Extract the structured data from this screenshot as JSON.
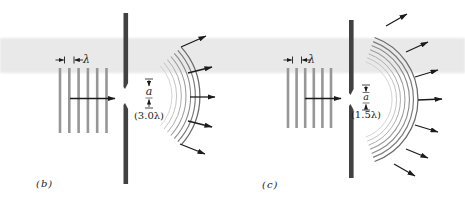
{
  "figure": {
    "background": "#ffffff",
    "ink": "#1b1b1b",
    "band": {
      "y": 38,
      "height": 35,
      "color": "#e9e9e9"
    },
    "panels": [
      {
        "id": "b",
        "caption": "(b)",
        "wavefronts": {
          "x0": 60,
          "spacing": 9.3,
          "count": 6,
          "y0": 68,
          "y1": 133,
          "width": 2.6,
          "color": "#979797"
        },
        "lambda_marker": {
          "label": "λ",
          "tick1": 64.5,
          "tick2": 74,
          "y": 60
        },
        "prop_arrow": {
          "x0": 70,
          "y0": 98.5,
          "x1": 115,
          "y1": 98.5
        },
        "barrier": {
          "x": 123.5,
          "width": 4.6,
          "top": [
            13,
            89
          ],
          "bottom": [
            103,
            184
          ],
          "color": "#414141"
        },
        "slit_annotation": {
          "letter": "a",
          "label": "(3.0λ)",
          "cx": 149,
          "tick_top_y": 79,
          "down_arrow": [
            80,
            86
          ],
          "rule_top_y": null,
          "rule_bottom_y": 98,
          "up_arrow": [
            107,
            99.5
          ],
          "tick_bottom_y": 108
        },
        "arcs": {
          "cx": 127,
          "cy": 96,
          "r0": 45,
          "r1": 73,
          "count": 7,
          "half_angle": 42,
          "shade_inner": 201,
          "shade_outer": 106
        },
        "ray_arrows": [
          {
            "x0": 181,
            "y0": 47,
            "x1": 206,
            "y1": 36
          },
          {
            "x0": 188,
            "y0": 73,
            "x1": 212,
            "y1": 67
          },
          {
            "x0": 190,
            "y0": 97,
            "x1": 215,
            "y1": 97
          },
          {
            "x0": 188,
            "y0": 121,
            "x1": 212,
            "y1": 127
          },
          {
            "x0": 180,
            "y0": 144,
            "x1": 205,
            "y1": 154
          }
        ]
      },
      {
        "id": "c",
        "caption": "(c)",
        "wavefronts": {
          "x0": 288,
          "spacing": 8.6,
          "count": 6,
          "y0": 68,
          "y1": 128,
          "width": 2.6,
          "color": "#979797"
        },
        "lambda_marker": {
          "label": "λ",
          "tick1": 292.5,
          "tick2": 301.5,
          "y": 60
        },
        "prop_arrow": {
          "x0": 305,
          "y0": 98.5,
          "x1": 341,
          "y1": 98.5
        },
        "barrier": {
          "x": 349,
          "width": 4.6,
          "top": [
            20,
            95
          ],
          "bottom": [
            104,
            178
          ],
          "color": "#414141"
        },
        "slit_annotation": {
          "letter": "a",
          "label": "(1.5λ)",
          "cx": 366,
          "tick_top_y": 85,
          "down_arrow": [
            86,
            91.5
          ],
          "rule_top_y": 92.5,
          "rule_bottom_y": 103,
          "up_arrow": [
            109,
            104.5
          ],
          "tick_bottom_y": 110
        },
        "arcs": {
          "cx": 352,
          "cy": 99.5,
          "r0": 40,
          "r1": 66,
          "count": 7,
          "half_angle": 70,
          "shade_inner": 201,
          "shade_outer": 106
        },
        "ray_arrows": [
          {
            "x0": 386,
            "y0": 26,
            "x1": 407,
            "y1": 14
          },
          {
            "x0": 406,
            "y0": 52,
            "x1": 428,
            "y1": 42
          },
          {
            "x0": 415,
            "y0": 77,
            "x1": 438,
            "y1": 70
          },
          {
            "x0": 418,
            "y0": 100,
            "x1": 442,
            "y1": 99
          },
          {
            "x0": 415,
            "y0": 125,
            "x1": 438,
            "y1": 132
          },
          {
            "x0": 406,
            "y0": 149,
            "x1": 428,
            "y1": 158
          },
          {
            "x0": 394,
            "y0": 164,
            "x1": 415,
            "y1": 176
          }
        ]
      }
    ]
  }
}
